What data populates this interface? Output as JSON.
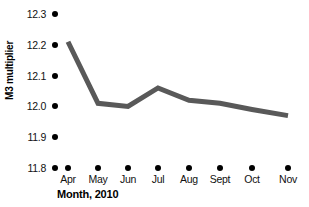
{
  "chart_data": {
    "type": "line",
    "title": "",
    "subtitle": "",
    "xlabel": "Month, 2010",
    "ylabel": "M3 multiplier",
    "categories": [
      "Apr",
      "May",
      "Jun",
      "Jul",
      "Aug",
      "Sept",
      "Oct",
      "Nov"
    ],
    "values": [
      12.21,
      12.01,
      12.0,
      12.06,
      12.02,
      12.01,
      11.99,
      11.97
    ],
    "series": [
      {
        "name": "M3 multiplier",
        "values": [
          12.21,
          12.01,
          12.0,
          12.06,
          12.02,
          12.01,
          11.99,
          11.97
        ]
      }
    ],
    "ylim": [
      11.8,
      12.3
    ],
    "yticks": [
      "12.3",
      "12.2",
      "12.1",
      "12.0",
      "11.9",
      "11.8"
    ],
    "ytick_values": [
      12.3,
      12.2,
      12.1,
      12.0,
      11.9,
      11.8
    ],
    "grid": false,
    "legend": "none",
    "line_color": "#595959",
    "tick_marker_color": "#000000"
  },
  "axes": {
    "y_title": "M3 multiplier",
    "x_title": "Month, 2010",
    "y_labels": {
      "t0": "12.3",
      "t1": "12.2",
      "t2": "12.1",
      "t3": "12.0",
      "t4": "11.9",
      "t5": "11.8"
    },
    "x_labels": {
      "c0": "Apr",
      "c1": "May",
      "c2": "Jun",
      "c3": "Jul",
      "c4": "Aug",
      "c5": "Sept",
      "c6": "Oct",
      "c7": "Nov"
    }
  },
  "colors": {
    "line": "#595959",
    "text": "#111111",
    "marker": "#000000",
    "background": "#ffffff"
  }
}
